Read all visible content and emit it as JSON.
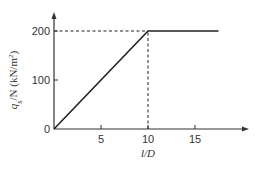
{
  "chart_data": {
    "type": "line",
    "title": "",
    "xlabel": "l/D",
    "ylabel": "q_s/N (kN/m²)",
    "ylabel_parts": {
      "q": "q",
      "sub": "s",
      "rest": "/N (kN/m",
      "sup": "2",
      "close": ")"
    },
    "xlim": [
      0,
      18.5
    ],
    "ylim": [
      0,
      230
    ],
    "grid": false,
    "legend": null,
    "x_ticks": [
      0,
      5,
      10,
      15
    ],
    "x_tick_labels": [
      "",
      "5",
      "10",
      "15"
    ],
    "y_ticks": [
      0,
      100,
      200
    ],
    "y_tick_labels": [
      "0",
      "100",
      "200"
    ],
    "series": [
      {
        "name": "q_s/N",
        "style": "solid",
        "x": [
          0,
          10,
          17.5
        ],
        "y": [
          0,
          200,
          200
        ]
      }
    ],
    "reference_lines": [
      {
        "type": "horizontal",
        "style": "dashed",
        "y": 200,
        "x_from": 0,
        "x_to": 10
      },
      {
        "type": "vertical",
        "style": "dashed",
        "x": 10,
        "y_from": 0,
        "y_to": 200
      }
    ],
    "annotations": []
  },
  "colors": {
    "line": "#222222",
    "axis": "#333333",
    "text": "#333333",
    "background": "#ffffff"
  }
}
